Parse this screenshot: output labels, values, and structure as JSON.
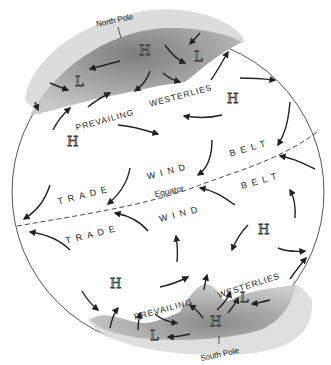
{
  "labels": {
    "north_pole": "North Pole",
    "south_pole": "South Pole",
    "equator": "Equator",
    "prevailing_n": "PREVAILING",
    "westerlies_n": "WESTERLIES",
    "trade_nw": "TRADE",
    "wind_n": "WIND",
    "belt_n": "BELT",
    "trade_sw": "TRADE",
    "wind_s": "WIND",
    "belt_s": "BELT",
    "prevailing_s": "PREVAILING",
    "westerlies_s": "WESTERLIES"
  },
  "pressure": {
    "high": "H",
    "low": "L"
  },
  "colors": {
    "outline": "#555555",
    "polar_dark": "#8a8a8a",
    "polar_light": "#d9d9d9",
    "arrow": "#222222"
  }
}
